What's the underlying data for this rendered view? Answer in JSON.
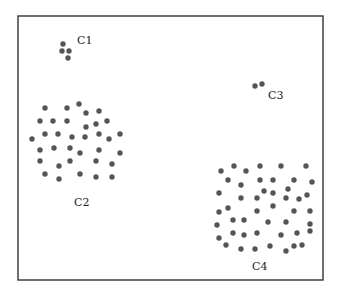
{
  "diagram": {
    "title": "",
    "frame": {
      "x": 18,
      "y": 16,
      "width": 305,
      "height": 264
    },
    "point_color": "#555555",
    "point_radius": 2.7,
    "clusters": [
      {
        "name": "C1",
        "label": "C1",
        "label_pos": [
          77,
          44
        ],
        "points": [
          [
            63,
            44
          ],
          [
            62,
            51
          ],
          [
            69,
            51
          ],
          [
            68,
            58
          ]
        ]
      },
      {
        "name": "C2",
        "label": "C2",
        "label_pos": [
          74,
          206
        ],
        "points": [
          [
            45,
            108
          ],
          [
            67,
            108
          ],
          [
            79,
            104
          ],
          [
            86,
            113
          ],
          [
            99,
            111
          ],
          [
            40,
            121
          ],
          [
            53,
            121
          ],
          [
            67,
            121
          ],
          [
            86,
            127
          ],
          [
            96,
            124
          ],
          [
            107,
            121
          ],
          [
            32,
            139
          ],
          [
            45,
            134
          ],
          [
            58,
            134
          ],
          [
            72,
            137
          ],
          [
            85,
            137
          ],
          [
            99,
            134
          ],
          [
            109,
            139
          ],
          [
            120,
            134
          ],
          [
            40,
            150
          ],
          [
            54,
            148
          ],
          [
            70,
            148
          ],
          [
            80,
            153
          ],
          [
            99,
            150
          ],
          [
            120,
            153
          ],
          [
            40,
            161
          ],
          [
            59,
            166
          ],
          [
            70,
            161
          ],
          [
            96,
            161
          ],
          [
            112,
            164
          ],
          [
            45,
            174
          ],
          [
            59,
            179
          ],
          [
            80,
            174
          ],
          [
            96,
            177
          ],
          [
            112,
            177
          ]
        ]
      },
      {
        "name": "C3",
        "label": "C3",
        "label_pos": [
          268,
          99
        ],
        "points": [
          [
            255,
            86
          ],
          [
            262,
            84
          ]
        ]
      },
      {
        "name": "C4",
        "label": "C4",
        "label_pos": [
          252,
          270
        ],
        "points": [
          [
            221,
            171
          ],
          [
            234,
            166
          ],
          [
            246,
            171
          ],
          [
            260,
            166
          ],
          [
            281,
            166
          ],
          [
            306,
            166
          ],
          [
            228,
            180
          ],
          [
            241,
            185
          ],
          [
            260,
            180
          ],
          [
            273,
            180
          ],
          [
            294,
            180
          ],
          [
            312,
            182
          ],
          [
            219,
            193
          ],
          [
            241,
            198
          ],
          [
            257,
            198
          ],
          [
            264,
            191
          ],
          [
            273,
            193
          ],
          [
            288,
            189
          ],
          [
            286,
            198
          ],
          [
            299,
            199
          ],
          [
            307,
            195
          ],
          [
            219,
            212
          ],
          [
            228,
            208
          ],
          [
            257,
            211
          ],
          [
            273,
            206
          ],
          [
            294,
            211
          ],
          [
            310,
            211
          ],
          [
            217,
            225
          ],
          [
            233,
            220
          ],
          [
            244,
            220
          ],
          [
            268,
            222
          ],
          [
            286,
            222
          ],
          [
            310,
            224
          ],
          [
            219,
            238
          ],
          [
            233,
            233
          ],
          [
            244,
            235
          ],
          [
            257,
            233
          ],
          [
            281,
            235
          ],
          [
            297,
            233
          ],
          [
            310,
            231
          ],
          [
            226,
            245
          ],
          [
            241,
            249
          ],
          [
            255,
            249
          ],
          [
            270,
            246
          ],
          [
            286,
            251
          ],
          [
            294,
            246
          ],
          [
            302,
            245
          ]
        ]
      }
    ]
  }
}
